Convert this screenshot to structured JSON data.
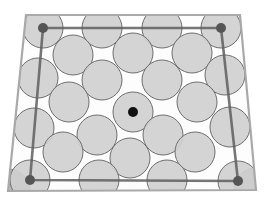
{
  "diagram": {
    "colors": {
      "background": "#ffffff",
      "circle_fill": "#cfcfcf",
      "circle_stroke": "#6e6e6e",
      "frame_outer": "#a9a9a9",
      "frame_inner": "#5e5e5e",
      "center_dot": "#111111",
      "corner_node": "#555555",
      "corner_quarter": "#b8b8b8"
    },
    "outer_frame": [
      [
        26,
        15
      ],
      [
        240,
        15
      ],
      [
        256,
        190
      ],
      [
        8,
        191
      ]
    ],
    "inner_frame": [
      [
        43,
        28
      ],
      [
        221,
        28
      ],
      [
        238,
        181
      ],
      [
        30,
        180
      ]
    ],
    "corner_nodes": [
      [
        43,
        28
      ],
      [
        221,
        28
      ],
      [
        30,
        180
      ],
      [
        238,
        181
      ]
    ],
    "center_dot": {
      "cx": 133,
      "cy": 112,
      "r": 5
    },
    "circle_radius": 20,
    "circles": [
      [
        43,
        28
      ],
      [
        102,
        28
      ],
      [
        162,
        28
      ],
      [
        221,
        28
      ],
      [
        73,
        55
      ],
      [
        133,
        53
      ],
      [
        192,
        53
      ],
      [
        38,
        78
      ],
      [
        102,
        80
      ],
      [
        162,
        80
      ],
      [
        225,
        75
      ],
      [
        69,
        102
      ],
      [
        133,
        112
      ],
      [
        197,
        102
      ],
      [
        34,
        128
      ],
      [
        97,
        135
      ],
      [
        163,
        135
      ],
      [
        230,
        127
      ],
      [
        63,
        152
      ],
      [
        130,
        158
      ],
      [
        195,
        152
      ],
      [
        30,
        180
      ],
      [
        99,
        180
      ],
      [
        167,
        180
      ],
      [
        238,
        181
      ]
    ],
    "corner_quarters": [
      [
        8,
        191
      ],
      [
        256,
        190
      ]
    ]
  }
}
